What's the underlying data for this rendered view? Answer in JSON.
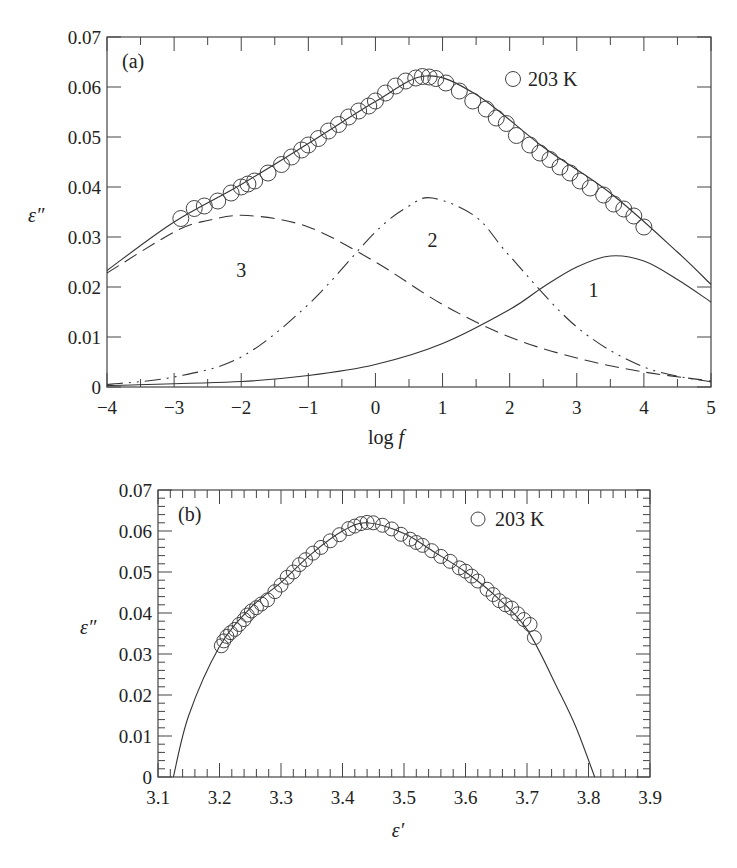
{
  "chart_data": [
    {
      "id": "a",
      "type": "line",
      "panel_label": "(a)",
      "title": "",
      "xlabel": "log f",
      "ylabel": "ε″",
      "xlim": [
        -4,
        5
      ],
      "ylim": [
        0,
        0.07
      ],
      "xticks": [
        "−4",
        "−3",
        "−2",
        "−1",
        "0",
        "1",
        "2",
        "3",
        "4",
        "5"
      ],
      "yticks": [
        "0",
        "0.01",
        "0.02",
        "0.03",
        "0.04",
        "0.05",
        "0.06",
        "0.07"
      ],
      "grid": false,
      "legend": {
        "position": "top-right",
        "entries": [
          {
            "marker": "open-circle",
            "label": "203 K"
          }
        ]
      },
      "curve_labels": [
        {
          "text": "3",
          "x": -2.0,
          "y": 0.022
        },
        {
          "text": "2",
          "x": 0.85,
          "y": 0.028
        },
        {
          "text": "1",
          "x": 3.25,
          "y": 0.018
        }
      ],
      "series": [
        {
          "name": "203 K (data)",
          "style": "open-circle",
          "x": [
            -2.9,
            -2.7,
            -2.55,
            -2.35,
            -2.15,
            -2.0,
            -1.9,
            -1.8,
            -1.6,
            -1.4,
            -1.25,
            -1.1,
            -1.0,
            -0.85,
            -0.7,
            -0.55,
            -0.4,
            -0.25,
            -0.1,
            0.0,
            0.15,
            0.3,
            0.45,
            0.6,
            0.7,
            0.8,
            0.9,
            1.05,
            1.25,
            1.45,
            1.65,
            1.8,
            1.95,
            2.1,
            2.3,
            2.45,
            2.6,
            2.75,
            2.9,
            3.05,
            3.2,
            3.4,
            3.55,
            3.7,
            3.85,
            4.0
          ],
          "y": [
            0.0337,
            0.0357,
            0.0362,
            0.0372,
            0.0388,
            0.04,
            0.0406,
            0.0412,
            0.0428,
            0.0445,
            0.046,
            0.0474,
            0.0484,
            0.0497,
            0.0512,
            0.0525,
            0.054,
            0.0552,
            0.0562,
            0.0572,
            0.0588,
            0.0602,
            0.0612,
            0.0618,
            0.0621,
            0.062,
            0.0617,
            0.0608,
            0.0592,
            0.0572,
            0.0556,
            0.0538,
            0.0527,
            0.0503,
            0.0484,
            0.0468,
            0.0455,
            0.044,
            0.0428,
            0.0412,
            0.0398,
            0.0384,
            0.0366,
            0.0356,
            0.0342,
            0.032
          ]
        },
        {
          "name": "fit (sum)",
          "style": "solid",
          "x": [
            -4,
            -3,
            -2,
            -1,
            0,
            0.75,
            1.5,
            2.5,
            3.5,
            4.5,
            5
          ],
          "y": [
            0.0233,
            0.033,
            0.0405,
            0.0487,
            0.0571,
            0.0622,
            0.0585,
            0.048,
            0.0388,
            0.027,
            0.0205
          ]
        },
        {
          "name": "1",
          "style": "solid",
          "x": [
            -4,
            -2,
            -1,
            0,
            1,
            2,
            2.5,
            3,
            3.5,
            4,
            4.5,
            5
          ],
          "y": [
            0.0003,
            0.0011,
            0.0023,
            0.0045,
            0.0087,
            0.0155,
            0.02,
            0.024,
            0.0262,
            0.0252,
            0.0215,
            0.017
          ]
        },
        {
          "name": "2",
          "style": "dash-dot-dot",
          "x": [
            -4,
            -3,
            -2,
            -1,
            0,
            0.5,
            0.85,
            1.5,
            2,
            3,
            4,
            5
          ],
          "y": [
            0.0005,
            0.002,
            0.006,
            0.0165,
            0.031,
            0.0362,
            0.0378,
            0.034,
            0.0262,
            0.012,
            0.004,
            0.001
          ]
        },
        {
          "name": "3",
          "style": "long-dash",
          "x": [
            -4,
            -3,
            -2.5,
            -1.9,
            -1,
            0,
            1,
            2,
            3,
            4,
            5
          ],
          "y": [
            0.0228,
            0.031,
            0.0333,
            0.0343,
            0.032,
            0.025,
            0.0165,
            0.01,
            0.0058,
            0.003,
            0.0012
          ]
        }
      ]
    },
    {
      "id": "b",
      "type": "scatter",
      "panel_label": "(b)",
      "title": "",
      "xlabel": "ε′",
      "ylabel": "ε″",
      "xlim": [
        3.1,
        3.9
      ],
      "ylim": [
        0,
        0.07
      ],
      "xticks": [
        "3.1",
        "3.2",
        "3.3",
        "3.4",
        "3.5",
        "3.6",
        "3.7",
        "3.8",
        "3.9"
      ],
      "yticks": [
        "0",
        "0.01",
        "0.02",
        "0.03",
        "0.04",
        "0.05",
        "0.06",
        "0.07"
      ],
      "grid": false,
      "legend": {
        "position": "top-right",
        "entries": [
          {
            "marker": "open-circle",
            "label": "203 K"
          }
        ]
      },
      "series": [
        {
          "name": "203 K (data)",
          "style": "open-circle",
          "x": [
            3.203,
            3.207,
            3.212,
            3.218,
            3.225,
            3.232,
            3.24,
            3.245,
            3.252,
            3.26,
            3.268,
            3.278,
            3.29,
            3.3,
            3.31,
            3.32,
            3.33,
            3.34,
            3.352,
            3.365,
            3.38,
            3.395,
            3.41,
            3.42,
            3.43,
            3.44,
            3.45,
            3.465,
            3.48,
            3.495,
            3.51,
            3.52,
            3.53,
            3.545,
            3.56,
            3.575,
            3.59,
            3.6,
            3.61,
            3.62,
            3.635,
            3.645,
            3.655,
            3.665,
            3.675,
            3.685,
            3.695,
            3.705,
            3.712
          ],
          "y": [
            0.032,
            0.0332,
            0.0343,
            0.0352,
            0.036,
            0.0372,
            0.0384,
            0.0395,
            0.0405,
            0.0413,
            0.0422,
            0.0432,
            0.0452,
            0.0468,
            0.0487,
            0.05,
            0.0518,
            0.053,
            0.0546,
            0.056,
            0.0576,
            0.0591,
            0.0606,
            0.0612,
            0.0618,
            0.0621,
            0.062,
            0.0614,
            0.0605,
            0.0592,
            0.058,
            0.0572,
            0.0565,
            0.0552,
            0.0538,
            0.0526,
            0.051,
            0.0502,
            0.049,
            0.0478,
            0.0458,
            0.0445,
            0.043,
            0.042,
            0.0412,
            0.0398,
            0.0384,
            0.0372,
            0.034
          ]
        },
        {
          "name": "fit",
          "style": "solid",
          "x": [
            3.125,
            3.15,
            3.2,
            3.25,
            3.3,
            3.35,
            3.4,
            3.44,
            3.5,
            3.55,
            3.6,
            3.65,
            3.7,
            3.75,
            3.78,
            3.81
          ],
          "y": [
            0.0,
            0.015,
            0.0318,
            0.0412,
            0.0475,
            0.0545,
            0.06,
            0.062,
            0.0594,
            0.0548,
            0.05,
            0.044,
            0.036,
            0.0215,
            0.012,
            0.0
          ]
        }
      ]
    }
  ]
}
